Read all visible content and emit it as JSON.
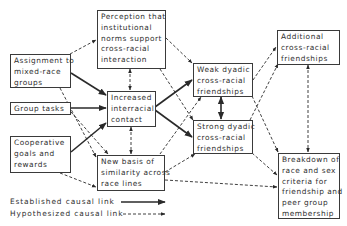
{
  "diagram": {
    "nodes": {
      "perception": {
        "lines": [
          "Perception that",
          "institutional",
          "norms support",
          "cross-racial",
          "interaction"
        ]
      },
      "assignment": {
        "lines": [
          "Assignment to",
          "mixed-race",
          "groups"
        ]
      },
      "group_tasks": {
        "lines": [
          "Group tasks"
        ]
      },
      "cooperative": {
        "lines": [
          "Cooperative",
          "goals and",
          "rewards"
        ]
      },
      "increased_contact": {
        "lines": [
          "Increased",
          "interracial",
          "contact"
        ]
      },
      "new_basis": {
        "lines": [
          "New basis of",
          "similarity across",
          "race lines"
        ]
      },
      "weak_dyadic": {
        "lines": [
          "Weak dyadic",
          "cross-racial",
          "friendships"
        ]
      },
      "strong_dyadic": {
        "lines": [
          "Strong dyadic",
          "cross-racial",
          "friendships"
        ]
      },
      "additional": {
        "lines": [
          "Additional",
          "cross-racial",
          "friendships"
        ]
      },
      "breakdown": {
        "lines": [
          "Breakdown of",
          "race and sex",
          "criteria for",
          "friendship and",
          "peer group",
          "membership"
        ]
      }
    },
    "edges": [
      {
        "from": "assignment",
        "to": "perception",
        "type": "hypothesized"
      },
      {
        "from": "assignment",
        "to": "increased_contact",
        "type": "established"
      },
      {
        "from": "assignment",
        "to": "new_basis",
        "type": "hypothesized"
      },
      {
        "from": "group_tasks",
        "to": "increased_contact",
        "type": "established"
      },
      {
        "from": "group_tasks",
        "to": "new_basis",
        "type": "hypothesized"
      },
      {
        "from": "cooperative",
        "to": "increased_contact",
        "type": "established"
      },
      {
        "from": "cooperative",
        "to": "new_basis",
        "type": "hypothesized"
      },
      {
        "from": "perception",
        "to": "increased_contact",
        "type": "hypothesized",
        "bidirectional": true
      },
      {
        "from": "perception",
        "to": "weak_dyadic",
        "type": "hypothesized"
      },
      {
        "from": "perception",
        "to": "strong_dyadic",
        "type": "hypothesized"
      },
      {
        "from": "increased_contact",
        "to": "weak_dyadic",
        "type": "established"
      },
      {
        "from": "increased_contact",
        "to": "strong_dyadic",
        "type": "established"
      },
      {
        "from": "increased_contact",
        "to": "new_basis",
        "type": "hypothesized",
        "bidirectional": true
      },
      {
        "from": "new_basis",
        "to": "weak_dyadic",
        "type": "hypothesized"
      },
      {
        "from": "new_basis",
        "to": "strong_dyadic",
        "type": "hypothesized"
      },
      {
        "from": "new_basis",
        "to": "breakdown",
        "type": "hypothesized"
      },
      {
        "from": "weak_dyadic",
        "to": "strong_dyadic",
        "type": "established",
        "bidirectional": true
      },
      {
        "from": "weak_dyadic",
        "to": "additional",
        "type": "hypothesized"
      },
      {
        "from": "weak_dyadic",
        "to": "breakdown",
        "type": "hypothesized"
      },
      {
        "from": "strong_dyadic",
        "to": "additional",
        "type": "hypothesized"
      },
      {
        "from": "strong_dyadic",
        "to": "breakdown",
        "type": "hypothesized"
      },
      {
        "from": "additional",
        "to": "breakdown",
        "type": "hypothesized",
        "bidirectional": true
      }
    ],
    "legend": {
      "established": "Established causal link",
      "hypothesized": "Hypothesized causal link"
    },
    "colors": {
      "line": "#2a2a2a",
      "border": "#3a3a3a",
      "text": "#2e2e2e",
      "background": "#ffffff"
    }
  }
}
